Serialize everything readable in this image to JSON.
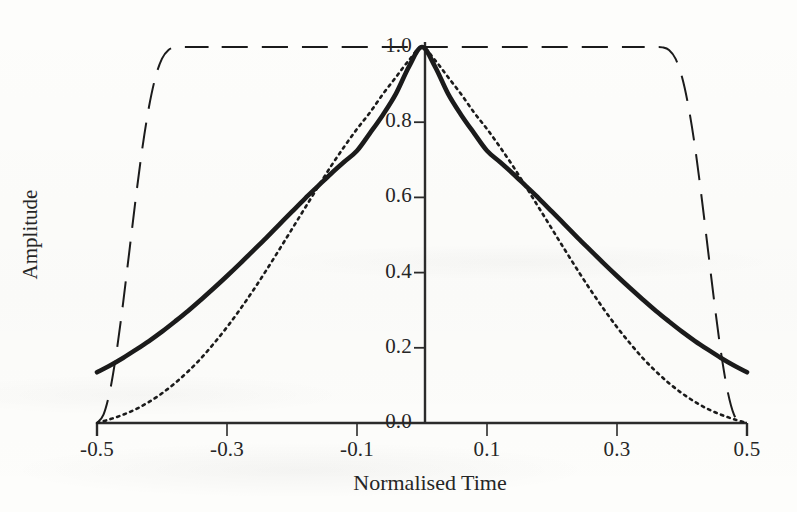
{
  "figure": {
    "background_color": "#fdfdfb",
    "ink_color": "#1b1b1b"
  },
  "chart_data": {
    "type": "line",
    "title": "",
    "xlabel": "Normalised Time",
    "ylabel": "Amplitude",
    "xlim": [
      -0.5,
      0.5
    ],
    "ylim": [
      0.0,
      1.0
    ],
    "grid": false,
    "legend": "none",
    "xticks": [
      -0.5,
      -0.3,
      -0.1,
      0.1,
      0.3,
      0.5
    ],
    "xtick_labels": [
      "-0.5",
      "-0.3",
      "-0.1",
      "0.1",
      "0.3",
      "0.5"
    ],
    "yticks": [
      0.0,
      0.2,
      0.4,
      0.6,
      0.8,
      1.0
    ],
    "ytick_labels": [
      "0.0",
      "0.2",
      "0.4",
      "0.6",
      "0.8",
      "1.0"
    ],
    "axis_style": "left-spine-at-x-zero-and-bottom-spine",
    "series": [
      {
        "name": "thick-solid-window",
        "style": "solid",
        "linewidth": 4,
        "color": "#1b1b1b",
        "x": [
          -0.5,
          -0.48,
          -0.46,
          -0.44,
          -0.42,
          -0.4,
          -0.38,
          -0.36,
          -0.34,
          -0.32,
          -0.3,
          -0.28,
          -0.26,
          -0.24,
          -0.22,
          -0.2,
          -0.18,
          -0.16,
          -0.14,
          -0.12,
          -0.1,
          -0.08,
          -0.06,
          -0.04,
          -0.02,
          0.0,
          0.02,
          0.04,
          0.06,
          0.08,
          0.1,
          0.12,
          0.14,
          0.16,
          0.18,
          0.2,
          0.22,
          0.24,
          0.26,
          0.28,
          0.3,
          0.32,
          0.34,
          0.36,
          0.38,
          0.4,
          0.42,
          0.44,
          0.46,
          0.48,
          0.5
        ],
        "y": [
          0.135,
          0.153,
          0.173,
          0.195,
          0.218,
          0.243,
          0.27,
          0.298,
          0.328,
          0.359,
          0.391,
          0.424,
          0.458,
          0.492,
          0.527,
          0.562,
          0.597,
          0.63,
          0.663,
          0.694,
          0.724,
          0.771,
          0.82,
          0.876,
          0.948,
          1.0,
          0.948,
          0.876,
          0.82,
          0.771,
          0.724,
          0.694,
          0.663,
          0.63,
          0.597,
          0.562,
          0.527,
          0.492,
          0.458,
          0.424,
          0.391,
          0.359,
          0.328,
          0.298,
          0.27,
          0.243,
          0.218,
          0.195,
          0.173,
          0.153,
          0.135
        ]
      },
      {
        "name": "dotted-window",
        "style": "dotted",
        "linewidth": 2,
        "color": "#1b1b1b",
        "x": [
          -0.5,
          -0.48,
          -0.46,
          -0.44,
          -0.42,
          -0.4,
          -0.38,
          -0.36,
          -0.34,
          -0.32,
          -0.3,
          -0.28,
          -0.26,
          -0.24,
          -0.22,
          -0.2,
          -0.18,
          -0.16,
          -0.14,
          -0.12,
          -0.1,
          -0.08,
          -0.06,
          -0.04,
          -0.02,
          0.0,
          0.02,
          0.04,
          0.06,
          0.08,
          0.1,
          0.12,
          0.14,
          0.16,
          0.18,
          0.2,
          0.22,
          0.24,
          0.26,
          0.28,
          0.3,
          0.32,
          0.34,
          0.36,
          0.38,
          0.4,
          0.42,
          0.44,
          0.46,
          0.48,
          0.5
        ],
        "y": [
          0.0,
          0.01,
          0.022,
          0.037,
          0.056,
          0.079,
          0.106,
          0.137,
          0.172,
          0.212,
          0.255,
          0.302,
          0.352,
          0.405,
          0.46,
          0.516,
          0.572,
          0.628,
          0.683,
          0.734,
          0.782,
          0.826,
          0.875,
          0.92,
          0.965,
          1.0,
          0.965,
          0.92,
          0.875,
          0.826,
          0.782,
          0.734,
          0.683,
          0.628,
          0.572,
          0.516,
          0.46,
          0.405,
          0.352,
          0.302,
          0.255,
          0.212,
          0.172,
          0.137,
          0.106,
          0.079,
          0.056,
          0.037,
          0.022,
          0.01,
          0.0
        ]
      },
      {
        "name": "long-dashed-tukey-window",
        "style": "long-dashed",
        "linewidth": 2,
        "color": "#1b1b1b",
        "x": [
          -0.5,
          -0.49,
          -0.48,
          -0.47,
          -0.46,
          -0.45,
          -0.44,
          -0.43,
          -0.42,
          -0.41,
          -0.4,
          -0.39,
          -0.38,
          -0.37,
          -0.36,
          -0.35,
          -0.34,
          -0.33,
          -0.32,
          -0.2,
          -0.1,
          0.0,
          0.1,
          0.2,
          0.32,
          0.33,
          0.34,
          0.35,
          0.36,
          0.37,
          0.38,
          0.39,
          0.4,
          0.41,
          0.42,
          0.43,
          0.44,
          0.45,
          0.46,
          0.47,
          0.48,
          0.49,
          0.5
        ],
        "y": [
          0.0,
          0.022,
          0.086,
          0.188,
          0.317,
          0.46,
          0.603,
          0.734,
          0.841,
          0.92,
          0.969,
          0.992,
          0.999,
          1.0,
          1.0,
          1.0,
          1.0,
          1.0,
          1.0,
          1.0,
          1.0,
          1.0,
          1.0,
          1.0,
          1.0,
          1.0,
          1.0,
          1.0,
          1.0,
          0.999,
          0.992,
          0.969,
          0.92,
          0.841,
          0.734,
          0.603,
          0.46,
          0.317,
          0.188,
          0.086,
          0.022,
          0.0,
          0.0
        ]
      }
    ]
  }
}
